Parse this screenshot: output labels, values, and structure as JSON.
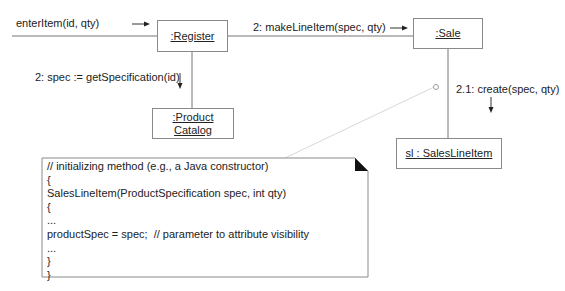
{
  "diagram": {
    "type": "UML collaboration diagram",
    "objects": {
      "register": ":Register",
      "sale": ":Sale",
      "product_catalog_line1": ":Product",
      "product_catalog_line2": "Catalog",
      "sales_line_item": "sl : SalesLineItem"
    },
    "messages": {
      "enter_item": "enterItem(id, qty)",
      "make_line_item": "2: makeLineItem(spec, qty)",
      "get_specification": "2: spec := getSpecification(id)",
      "create": "2.1: create(spec, qty)"
    },
    "note": {
      "lines": [
        "// initializing method (e.g., a Java constructor)",
        "{",
        "SalesLineItem(ProductSpecification spec, int qty)",
        "{",
        "...",
        "productSpec = spec;  // parameter to attribute visibility",
        "...",
        "}",
        "}"
      ]
    }
  }
}
